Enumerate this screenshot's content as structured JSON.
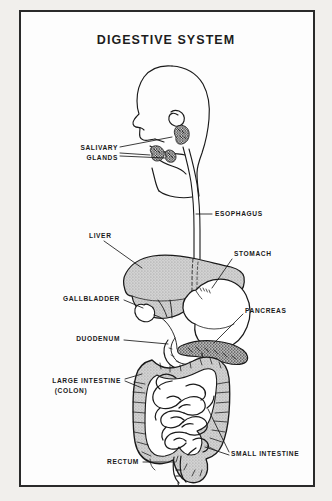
{
  "figure": {
    "title": "DIGESTIVE SYSTEM",
    "type": "anatomical-diagram",
    "border_color": "#2a2a2a",
    "background_color": "#fdfdfd",
    "ink_color": "#1a1a1a",
    "organ_shading_color": "#c9c9c9",
    "labels": [
      {
        "id": "salivary-glands",
        "text_lines": [
          "SALIVARY",
          "GLANDS"
        ],
        "align": "right",
        "x": 118,
        "y": 148
      },
      {
        "id": "esophagus",
        "text_lines": [
          "ESOPHAGUS"
        ],
        "align": "left",
        "x": 215,
        "y": 212
      },
      {
        "id": "liver",
        "text_lines": [
          "LIVER"
        ],
        "align": "left",
        "x": 89,
        "y": 234
      },
      {
        "id": "stomach",
        "text_lines": [
          "STOMACH"
        ],
        "align": "left",
        "x": 234,
        "y": 252
      },
      {
        "id": "gallbladder",
        "text_lines": [
          "GALLBLADDER"
        ],
        "align": "right",
        "x": 120,
        "y": 297
      },
      {
        "id": "pancreas",
        "text_lines": [
          "PANCREAS"
        ],
        "align": "left",
        "x": 245,
        "y": 309
      },
      {
        "id": "duodenum",
        "text_lines": [
          "DUODENUM"
        ],
        "align": "right",
        "x": 120,
        "y": 337
      },
      {
        "id": "large-intestine",
        "text_lines": [
          "LARGE INTESTINE",
          "(COLON)"
        ],
        "align": "right",
        "x": 121,
        "y": 380
      },
      {
        "id": "small-intestine",
        "text_lines": [
          "SMALL INTESTINE"
        ],
        "align": "left",
        "x": 231,
        "y": 452
      },
      {
        "id": "rectum",
        "text_lines": [
          "RECTUM"
        ],
        "align": "right",
        "x": 139,
        "y": 460
      }
    ]
  }
}
